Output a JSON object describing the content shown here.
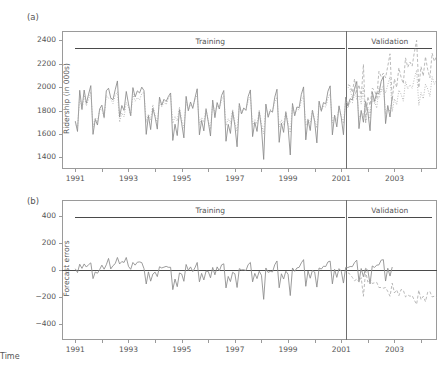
{
  "figure": {
    "panel_a_label": "(a)",
    "panel_b_label": "(b)",
    "xlabel": "Time",
    "training_label": "Training",
    "validation_label": "Validation",
    "line_color": "#8a8a8a",
    "forecast_color": "#a8a8a8",
    "axis_color": "#9a9a9a"
  },
  "chart_data": [
    {
      "type": "line",
      "title": "(a)",
      "xlabel": "",
      "ylabel": "Ridership (in 000s)",
      "xlim": [
        1990.5,
        2004.6
      ],
      "ylim": [
        1300,
        2480
      ],
      "yticks": [
        1400,
        1600,
        1800,
        2000,
        2200,
        2400
      ],
      "xticks": [
        1991,
        1993,
        1995,
        1997,
        1999,
        2001,
        2003
      ],
      "grid": false,
      "legend": "none",
      "annotations": [
        {
          "text": "Training",
          "x_range": [
            1991.0,
            2001.15
          ]
        },
        {
          "text": "Validation",
          "x_range": [
            2001.25,
            2004.4
          ]
        }
      ],
      "split_x": 2001.17,
      "series": [
        {
          "name": "Actual ridership",
          "style": "solid",
          "x_start": 1991.0,
          "x_step": 0.08333,
          "values": [
            1709,
            1621,
            1973,
            1812,
            1975,
            1862,
            1940,
            2013,
            1596,
            1725,
            1676,
            1814,
            1846,
            1741,
            1969,
            1991,
            1908,
            1892,
            1977,
            2053,
            1745,
            1843,
            1801,
            1963,
            1857,
            1755,
            1996,
            1916,
            1968,
            1950,
            2000,
            1970,
            1596,
            1756,
            1637,
            1820,
            1744,
            1641,
            1914,
            1845,
            1896,
            1877,
            1920,
            1950,
            1544,
            1683,
            1586,
            1808,
            1690,
            1566,
            1921,
            1798,
            1873,
            1818,
            1907,
            1986,
            1592,
            1715,
            1626,
            1812,
            1704,
            1582,
            1889,
            1739,
            1868,
            1813,
            1928,
            1971,
            1537,
            1682,
            1604,
            1793,
            1672,
            1490,
            1860,
            1771,
            1822,
            1801,
            1920,
            1976,
            1577,
            1700,
            1621,
            1791,
            1651,
            1382,
            1855,
            1742,
            1800,
            1786,
            1914,
            1982,
            1528,
            1692,
            1613,
            1786,
            1664,
            1420,
            1860,
            1755,
            1830,
            1825,
            1938,
            2002,
            1549,
            1722,
            1629,
            1802,
            1705,
            1523,
            1880,
            1797,
            1868,
            1856,
            1965,
            2011,
            1592,
            1760,
            1660,
            1840,
            1741,
            1593,
            1914,
            1838,
            1901,
            1890,
            1990,
            2048,
            1645,
            1801,
            1700,
            1877,
            1788,
            1627,
            1960,
            1879,
            1951,
            1943,
            2048,
            2092,
            1688,
            1843,
            1745,
            1922
          ]
        },
        {
          "name": "Fitted / Forecast",
          "style": "dotted",
          "x_start": 1991.0,
          "x_step": 0.08333,
          "values": [
            1700,
            1640,
            1930,
            1800,
            1930,
            1840,
            1900,
            1960,
            1660,
            1740,
            1700,
            1810,
            1810,
            1735,
            1930,
            1905,
            1900,
            1860,
            1930,
            1960,
            1700,
            1780,
            1745,
            1870,
            1830,
            1750,
            1940,
            1880,
            1910,
            1890,
            1945,
            1960,
            1700,
            1770,
            1720,
            1850,
            1760,
            1690,
            1890,
            1830,
            1875,
            1850,
            1900,
            1930,
            1690,
            1750,
            1710,
            1830,
            1720,
            1650,
            1880,
            1800,
            1850,
            1830,
            1890,
            1930,
            1680,
            1740,
            1700,
            1820,
            1715,
            1640,
            1870,
            1775,
            1845,
            1820,
            1890,
            1925,
            1670,
            1730,
            1690,
            1810,
            1700,
            1620,
            1850,
            1770,
            1820,
            1805,
            1880,
            1920,
            1665,
            1725,
            1685,
            1800,
            1690,
            1600,
            1840,
            1760,
            1810,
            1800,
            1875,
            1915,
            1660,
            1720,
            1680,
            1795,
            1695,
            1610,
            1845,
            1765,
            1815,
            1805,
            1885,
            1925,
            1670,
            1730,
            1690,
            1805,
            1720,
            1650,
            1865,
            1790,
            1840,
            1830,
            1905,
            1945,
            1695,
            1755,
            1715,
            1830,
            1750,
            1690,
            1895,
            1820,
            1875,
            1865,
            1935,
            1975,
            1730,
            1790,
            1750,
            1865,
            1790,
            1730,
            1930,
            1860,
            1915,
            1905,
            1975,
            2015,
            1770,
            1830,
            1790,
            1900
          ]
        },
        {
          "name": "Actual ridership (validation)",
          "style": "dashed",
          "x_start": 2001.25,
          "x_step": 0.08333,
          "values": [
            2020,
            2012,
            1955,
            2070,
            1958,
            2020,
            1912,
            2195,
            1698,
            1920,
            1843,
            1990,
            1975,
            1912,
            2135,
            2090,
            2120,
            2080,
            2180,
            2285,
            1888,
            2070,
            1998,
            2165,
            2085,
            2030,
            2250,
            2170,
            2215,
            2180,
            2300,
            2400,
            1995,
            2175,
            2095,
            2260,
            2150,
            2080,
            2290,
            2220,
            2265,
            2240,
            2340,
            2105,
            2090,
            2150
          ]
        },
        {
          "name": "Forecast (validation)",
          "style": "dotted",
          "x_start": 2001.25,
          "x_step": 0.08333,
          "values": [
            2000,
            1980,
            1900,
            1990,
            1890,
            1930,
            1855,
            2000,
            1690,
            1830,
            1775,
            1890,
            1880,
            1820,
            2005,
            1960,
            1985,
            1950,
            2020,
            2090,
            1790,
            1900,
            1850,
            1975,
            1940,
            1880,
            2050,
            1985,
            2020,
            1990,
            2075,
            2145,
            1845,
            1955,
            1900,
            2025,
            1985,
            1920,
            2090,
            2025,
            2060,
            2030,
            2110,
            1900,
            1880,
            1930
          ]
        }
      ]
    },
    {
      "type": "line",
      "title": "(b)",
      "xlabel": "Time",
      "ylabel": "Forecast errors",
      "xlim": [
        1990.5,
        2004.6
      ],
      "ylim": [
        -520,
        520
      ],
      "yticks": [
        -400,
        -200,
        0,
        200,
        400
      ],
      "xticks": [
        1991,
        1993,
        1995,
        1997,
        1999,
        2001,
        2003
      ],
      "grid": false,
      "legend": "none",
      "zero_line": 0,
      "split_x": 2001.17,
      "annotations": [
        {
          "text": "Training",
          "x_range": [
            1991.0,
            2001.15
          ]
        },
        {
          "text": "Validation",
          "x_range": [
            2001.25,
            2004.4
          ]
        }
      ],
      "series": [
        {
          "name": "Training errors",
          "style": "solid",
          "x_start": 1991.0,
          "x_step": 0.08333,
          "values": [
            9,
            -19,
            43,
            12,
            45,
            22,
            40,
            53,
            -64,
            -15,
            -24,
            4,
            36,
            6,
            39,
            86,
            8,
            32,
            47,
            93,
            45,
            63,
            56,
            93,
            27,
            5,
            56,
            36,
            58,
            60,
            55,
            10,
            -104,
            -14,
            -83,
            -30,
            -16,
            -49,
            24,
            15,
            21,
            27,
            20,
            20,
            -146,
            -67,
            -124,
            -22,
            -30,
            -84,
            41,
            -2,
            23,
            -12,
            17,
            56,
            -88,
            -25,
            -74,
            -8,
            -11,
            -58,
            19,
            -36,
            23,
            -7,
            38,
            46,
            -133,
            -48,
            -86,
            -17,
            -28,
            -130,
            10,
            1,
            2,
            -4,
            40,
            56,
            -88,
            -25,
            -64,
            -9,
            -39,
            -218,
            15,
            -18,
            -10,
            -14,
            39,
            67,
            -132,
            -28,
            -67,
            -9,
            -31,
            -190,
            15,
            -10,
            15,
            20,
            53,
            77,
            -121,
            -8,
            -61,
            -3,
            -15,
            -127,
            15,
            7,
            28,
            26,
            60,
            66,
            -103,
            5,
            -55,
            10,
            -9,
            -97,
            19,
            18,
            26,
            25,
            55,
            73,
            -85,
            11,
            -50,
            12,
            -2,
            -103,
            30,
            19,
            36,
            38,
            73,
            77,
            -82,
            13,
            -45,
            22
          ]
        },
        {
          "name": "Validation errors",
          "style": "dashed",
          "x_start": 2001.25,
          "x_step": 0.08333,
          "values": [
            20,
            32,
            55,
            80,
            68,
            90,
            57,
            195,
            8,
            90,
            68,
            100,
            95,
            92,
            130,
            130,
            135,
            130,
            160,
            195,
            98,
            170,
            148,
            190,
            145,
            150,
            200,
            185,
            195,
            190,
            225,
            255,
            150,
            220,
            195,
            235,
            165,
            160,
            200,
            195,
            205,
            210,
            230,
            205,
            210,
            220
          ],
          "sign": "negative"
        }
      ]
    }
  ]
}
